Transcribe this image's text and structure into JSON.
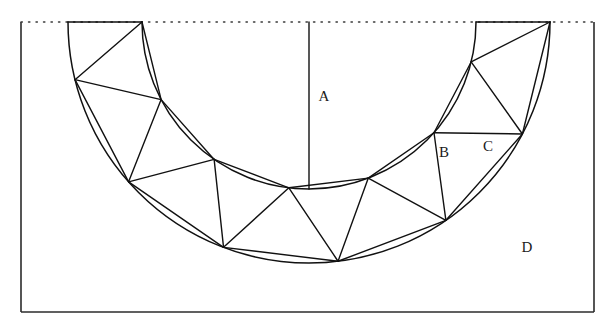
{
  "figure": {
    "background_color": "#ffffff",
    "stroke_color": "#111111",
    "frame_color": "#2b2b2b",
    "width": 614,
    "height": 327
  },
  "frame": {
    "left": 21,
    "right": 594,
    "top": 22,
    "bottom": 312,
    "top_edge_style": "dotted",
    "side_edge_style": "solid"
  },
  "geometry": {
    "center_x": 309,
    "center_y": 22,
    "outer_radius": 241,
    "inner_radius": 167,
    "semicircle_span_degrees": 180,
    "triangle_count": 13,
    "zigzag_segments": 26,
    "outer_vertex_count": 7,
    "inner_vertex_count": 7,
    "vertical_radius_present": true
  },
  "labels": [
    {
      "id": "A",
      "text": "A",
      "x": 324,
      "y": 98,
      "region": "inner-semicircle-sector"
    },
    {
      "id": "B",
      "text": "B",
      "x": 444,
      "y": 154,
      "region": "zigzag-triangle-apex-outward"
    },
    {
      "id": "C",
      "text": "C",
      "x": 488,
      "y": 148,
      "region": "zigzag-triangle-apex-inward"
    },
    {
      "id": "D",
      "text": "D",
      "x": 527,
      "y": 249,
      "region": "outside-annulus"
    }
  ],
  "legend": {
    "A_description": "inner semicircular region bounded by the inner arc and the horizontal diameter",
    "B_description": "zigzag triangle with base on the outer arc",
    "C_description": "zigzag triangle with base on the inner arc",
    "D_description": "region of the rectangle outside the outer arc"
  }
}
